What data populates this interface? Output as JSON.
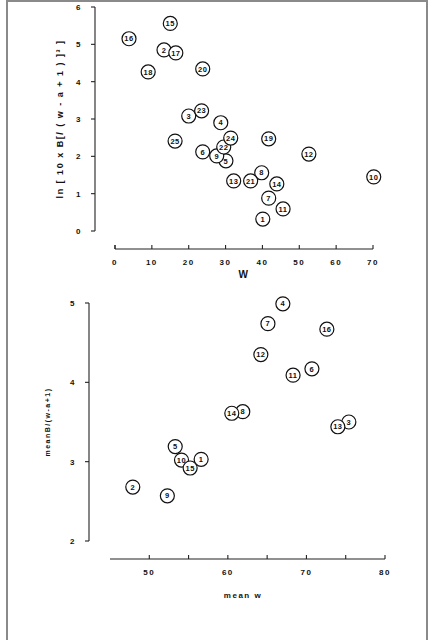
{
  "chart_data": [
    {
      "type": "scatter",
      "title": "",
      "xlabel": "W",
      "ylabel": "ln [ 10 x B[/ ( w - a + 1 ) ]³ ]",
      "xlim": [
        0,
        70
      ],
      "ylim": [
        0,
        6
      ],
      "xticks": [
        0,
        10,
        20,
        30,
        40,
        50,
        60,
        70
      ],
      "yticks": [
        0,
        1,
        2,
        3,
        4,
        5,
        6
      ],
      "grid": false,
      "marker": "circled point labels",
      "points": [
        {
          "label": "1",
          "x": 40.1,
          "y": 0.32
        },
        {
          "label": "2",
          "x": 13.3,
          "y": 4.85
        },
        {
          "label": "3",
          "x": 20.0,
          "y": 3.08
        },
        {
          "label": "4",
          "x": 28.7,
          "y": 2.9
        },
        {
          "label": "5",
          "x": 30.1,
          "y": 1.88
        },
        {
          "label": "6",
          "x": 23.8,
          "y": 2.12
        },
        {
          "label": "7",
          "x": 41.7,
          "y": 0.88
        },
        {
          "label": "8",
          "x": 39.8,
          "y": 1.56
        },
        {
          "label": "9",
          "x": 27.6,
          "y": 2.01
        },
        {
          "label": "10",
          "x": 70.2,
          "y": 1.45
        },
        {
          "label": "11",
          "x": 45.6,
          "y": 0.59
        },
        {
          "label": "12",
          "x": 52.6,
          "y": 2.06
        },
        {
          "label": "13",
          "x": 32.2,
          "y": 1.34
        },
        {
          "label": "14",
          "x": 43.9,
          "y": 1.26
        },
        {
          "label": "15",
          "x": 15.0,
          "y": 5.56
        },
        {
          "label": "16",
          "x": 3.8,
          "y": 5.15
        },
        {
          "label": "17",
          "x": 16.5,
          "y": 4.77
        },
        {
          "label": "18",
          "x": 9.0,
          "y": 4.26
        },
        {
          "label": "19",
          "x": 41.7,
          "y": 2.47
        },
        {
          "label": "20",
          "x": 23.8,
          "y": 4.34
        },
        {
          "label": "21",
          "x": 36.8,
          "y": 1.34
        },
        {
          "label": "22",
          "x": 29.5,
          "y": 2.25
        },
        {
          "label": "23",
          "x": 23.5,
          "y": 3.22
        },
        {
          "label": "24",
          "x": 31.4,
          "y": 2.49
        },
        {
          "label": "25",
          "x": 16.3,
          "y": 2.41
        }
      ]
    },
    {
      "type": "scatter",
      "title": "",
      "xlabel": "mean   w",
      "ylabel": "meanB/(w-a+1)",
      "xlim": [
        45,
        80
      ],
      "ylim": [
        2,
        5
      ],
      "xticks": [
        50,
        60,
        70,
        80
      ],
      "xminor_ticks": [
        55,
        65,
        75
      ],
      "yticks": [
        2,
        3,
        4,
        5
      ],
      "grid": false,
      "marker": "circled point labels",
      "points": [
        {
          "label": "1",
          "x": 56.6,
          "y": 3.03
        },
        {
          "label": "2",
          "x": 47.9,
          "y": 2.68
        },
        {
          "label": "3",
          "x": 75.4,
          "y": 3.5
        },
        {
          "label": "4",
          "x": 67.0,
          "y": 4.99
        },
        {
          "label": "5",
          "x": 53.3,
          "y": 3.19
        },
        {
          "label": "6",
          "x": 70.7,
          "y": 4.17
        },
        {
          "label": "7",
          "x": 65.1,
          "y": 4.74
        },
        {
          "label": "8",
          "x": 61.9,
          "y": 3.63
        },
        {
          "label": "9",
          "x": 52.3,
          "y": 2.57
        },
        {
          "label": "10",
          "x": 54.1,
          "y": 3.02
        },
        {
          "label": "11",
          "x": 68.3,
          "y": 4.09
        },
        {
          "label": "12",
          "x": 64.2,
          "y": 4.35
        },
        {
          "label": "13",
          "x": 74.0,
          "y": 3.44
        },
        {
          "label": "14",
          "x": 60.5,
          "y": 3.61
        },
        {
          "label": "15",
          "x": 55.2,
          "y": 2.92
        },
        {
          "label": "16",
          "x": 72.6,
          "y": 4.67
        }
      ]
    }
  ],
  "layout": {
    "top": {
      "x0px": 115,
      "x1px": 373,
      "y0px": 231,
      "y1px": 7,
      "xaxis_y": 249,
      "yaxis_x": 95
    },
    "bottom": {
      "x0px": 110,
      "x1px": 385,
      "y0px": 541,
      "y1px": 303,
      "xaxis_y": 559,
      "yaxis_x": 89
    }
  },
  "colors": {
    "ink": "#111111",
    "frame": "#8a8a8a",
    "background": "#ffffff"
  }
}
